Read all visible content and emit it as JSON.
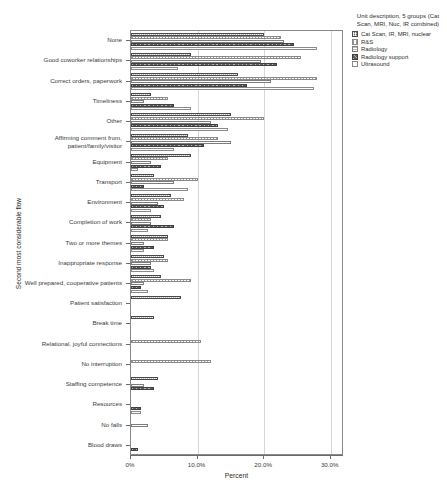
{
  "chart_data": {
    "type": "bar",
    "orientation": "horizontal",
    "grouped": true,
    "title": "",
    "xlabel": "Percent",
    "ylabel": "Second most considerable flow",
    "xlim": [
      0,
      32
    ],
    "xticks": [
      0,
      10,
      20,
      30
    ],
    "xtick_labels": [
      "0%",
      "10.0%",
      "20.0%",
      "30.0%"
    ],
    "grid": "vertical",
    "legend_position": "top-right",
    "legend_title": "Unit description, 5 groups (Cat Scan, MRI, Nuc, IR combined)",
    "categories": [
      "None",
      "Good coworker relationships",
      "Correct orders, paperwork",
      "Timeliness",
      "Other",
      "Affirming comment from, patient/family/visitor",
      "Equipment",
      "Transport",
      "Environment",
      "Completion of work",
      "Two or more themes",
      "Inappropriate response",
      "Well prepared, cooperative patients",
      "Patient satisfaction",
      "Break time",
      "Relational, joyful connections",
      "No interruption",
      "Staffing competence",
      "Resources",
      "No falls",
      "Blood draws"
    ],
    "series": [
      {
        "name": "Cat Scan, IR, MRI, nuclear",
        "pattern": "dense-crosshatch",
        "values": [
          20.0,
          9.0,
          16.0,
          3.0,
          15.0,
          8.5,
          9.0,
          3.5,
          6.0,
          4.5,
          5.5,
          5.0,
          4.5,
          7.5,
          3.5,
          0.0,
          0.0,
          4.0,
          0.0,
          0.0,
          0.0
        ]
      },
      {
        "name": "R&S",
        "pattern": "dotted-light",
        "values": [
          22.5,
          25.5,
          28.0,
          5.5,
          20.0,
          13.0,
          5.5,
          10.0,
          8.0,
          3.0,
          5.5,
          5.5,
          9.0,
          0.0,
          0.0,
          10.5,
          12.0,
          0.0,
          0.0,
          0.0,
          0.0
        ]
      },
      {
        "name": "Radiology",
        "pattern": "horizontal-lines",
        "values": [
          23.0,
          19.5,
          21.0,
          2.0,
          12.0,
          15.0,
          3.0,
          6.5,
          4.0,
          3.0,
          2.0,
          3.0,
          2.0,
          0.0,
          0.0,
          0.0,
          0.0,
          2.0,
          0.0,
          2.5,
          0.0
        ]
      },
      {
        "name": "Radiology support",
        "pattern": "diagonal-hatch",
        "values": [
          24.5,
          22.0,
          17.5,
          6.5,
          13.0,
          11.0,
          4.5,
          2.0,
          5.0,
          6.5,
          3.5,
          3.0,
          1.5,
          0.0,
          0.0,
          0.0,
          0.0,
          3.5,
          1.5,
          0.0,
          1.0
        ]
      },
      {
        "name": "Ultrasound",
        "pattern": "empty-white",
        "values": [
          28.0,
          7.0,
          27.5,
          9.0,
          14.5,
          6.5,
          1.0,
          8.5,
          3.0,
          2.5,
          2.0,
          3.5,
          2.5,
          0.0,
          0.0,
          0.0,
          0.0,
          0.0,
          1.5,
          0.0,
          0.0
        ]
      }
    ]
  }
}
